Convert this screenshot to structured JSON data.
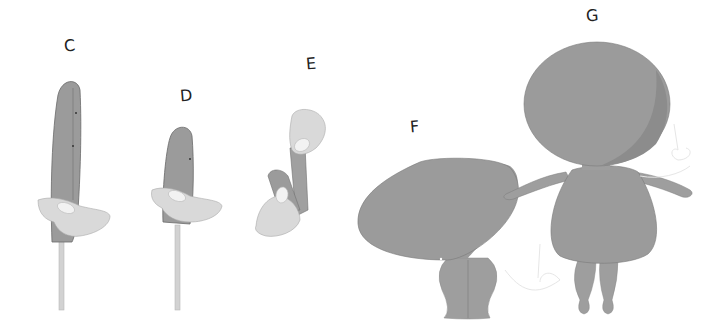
{
  "figure": {
    "panels": [
      {
        "label": "C",
        "subject": "rod-mounted tall paddle puppet held by hand, front-side view"
      },
      {
        "label": "D",
        "subject": "rod-mounted short paddle puppet held by hand"
      },
      {
        "label": "E",
        "subject": "two hands manipulating folded puppet piece"
      },
      {
        "label": "F",
        "subject": "rounded body puppet with two legs and string"
      },
      {
        "label": "G",
        "subject": "full figure with large round head, arms, body and legs"
      }
    ],
    "colors": {
      "body_fill": "#9a9a9a",
      "body_shadow": "#8a8a8a",
      "hand_fill": "#d8d8d8",
      "nail_fill": "#f2f2f2",
      "rod": "#cfcfcf",
      "outline": "#6f6f6f",
      "label_text": "#222222"
    }
  }
}
